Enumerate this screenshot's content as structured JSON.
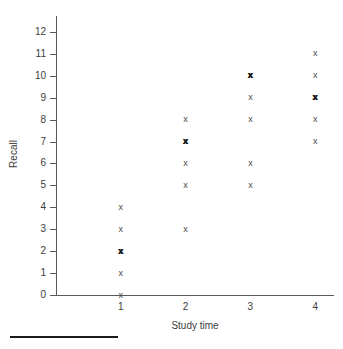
{
  "chart_data": {
    "type": "scatter",
    "title": "",
    "xlabel": "Study time",
    "ylabel": "Recall",
    "xlim": [
      0,
      4.6
    ],
    "ylim": [
      0,
      12.6
    ],
    "grid": false,
    "legend": null,
    "marker": "x",
    "x_ticks": [
      "1",
      "2",
      "3",
      "4"
    ],
    "x_tick_values": [
      1,
      2,
      3,
      4
    ],
    "y_ticks": [
      "0",
      "1",
      "2",
      "3",
      "4",
      "5",
      "6",
      "7",
      "8",
      "9",
      "10",
      "11",
      "12"
    ],
    "y_tick_values": [
      0,
      1,
      2,
      3,
      4,
      5,
      6,
      7,
      8,
      9,
      10,
      11,
      12
    ],
    "points": [
      {
        "x": 1,
        "y": 0,
        "count": 1
      },
      {
        "x": 1,
        "y": 1,
        "count": 1
      },
      {
        "x": 1,
        "y": 2,
        "count": 2
      },
      {
        "x": 1,
        "y": 3,
        "count": 1
      },
      {
        "x": 1,
        "y": 4,
        "count": 1
      },
      {
        "x": 2,
        "y": 3,
        "count": 1
      },
      {
        "x": 2,
        "y": 5,
        "count": 1
      },
      {
        "x": 2,
        "y": 6,
        "count": 1
      },
      {
        "x": 2,
        "y": 7,
        "count": 2
      },
      {
        "x": 2,
        "y": 8,
        "count": 1
      },
      {
        "x": 3,
        "y": 5,
        "count": 1
      },
      {
        "x": 3,
        "y": 6,
        "count": 1
      },
      {
        "x": 3,
        "y": 8,
        "count": 1
      },
      {
        "x": 3,
        "y": 9,
        "count": 1
      },
      {
        "x": 3,
        "y": 10,
        "count": 2
      },
      {
        "x": 4,
        "y": 7,
        "count": 1
      },
      {
        "x": 4,
        "y": 8,
        "count": 1
      },
      {
        "x": 4,
        "y": 9,
        "count": 2
      },
      {
        "x": 4,
        "y": 10,
        "count": 1
      },
      {
        "x": 4,
        "y": 11,
        "count": 1
      }
    ],
    "series": [
      {
        "name": "Recall vs Study time",
        "x": [
          1,
          1,
          1,
          1,
          1,
          1,
          2,
          2,
          2,
          2,
          2,
          2,
          3,
          3,
          3,
          3,
          3,
          3,
          4,
          4,
          4,
          4,
          4,
          4
        ],
        "y": [
          0,
          1,
          2,
          2,
          3,
          4,
          3,
          5,
          6,
          7,
          7,
          8,
          5,
          6,
          8,
          9,
          10,
          10,
          7,
          8,
          9,
          9,
          10,
          11
        ]
      }
    ]
  },
  "axis": {
    "x_title": "Study time",
    "y_title": "Recall"
  },
  "footer": {
    "rule": ""
  }
}
